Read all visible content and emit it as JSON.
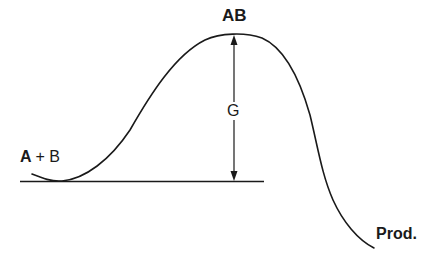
{
  "diagram": {
    "type": "reaction-energy-profile",
    "labels": {
      "transition_state": "AB",
      "reactants": "A + B",
      "reactants_a": "A",
      "reactants_plus": "+",
      "reactants_b": "B",
      "energy_gap": "G",
      "products": "Prod."
    },
    "colors": {
      "line": "#1a1a1a",
      "background": "#ffffff"
    }
  }
}
